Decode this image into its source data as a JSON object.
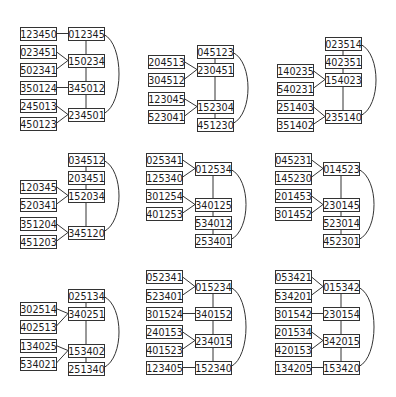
{
  "diagram": {
    "title": "",
    "box_size": {
      "w": 36,
      "h": 13
    },
    "colors": {
      "stroke": "#333333",
      "text": "#1a1a1a",
      "background": "#ffffff"
    },
    "panels": [
      {
        "id": "p1",
        "nodes": [
          {
            "id": "a",
            "label": "123450",
            "x": 20,
            "y": 27
          },
          {
            "id": "b",
            "label": "023451",
            "x": 20,
            "y": 45
          },
          {
            "id": "c",
            "label": "502341",
            "x": 20,
            "y": 63
          },
          {
            "id": "d",
            "label": "350124",
            "x": 20,
            "y": 81
          },
          {
            "id": "e",
            "label": "245013",
            "x": 20,
            "y": 99
          },
          {
            "id": "f",
            "label": "450123",
            "x": 20,
            "y": 117
          },
          {
            "id": "R1",
            "label": "012345",
            "x": 68,
            "y": 27
          },
          {
            "id": "R2",
            "label": "150234",
            "x": 68,
            "y": 54
          },
          {
            "id": "R3",
            "label": "345012",
            "x": 68,
            "y": 81
          },
          {
            "id": "R4",
            "label": "234501",
            "x": 68,
            "y": 108
          }
        ],
        "edges": [
          [
            "a",
            "R1"
          ],
          [
            "b",
            "R2"
          ],
          [
            "c",
            "R2"
          ],
          [
            "d",
            "R3"
          ],
          [
            "e",
            "R4"
          ],
          [
            "f",
            "R4"
          ],
          [
            "R1",
            "R2"
          ],
          [
            "R2",
            "R3"
          ],
          [
            "R3",
            "R4"
          ]
        ],
        "arc": [
          "R1",
          "R4"
        ]
      },
      {
        "id": "p2",
        "nodes": [
          {
            "id": "a",
            "label": "204513",
            "x": 148,
            "y": 55
          },
          {
            "id": "b",
            "label": "304512",
            "x": 148,
            "y": 73
          },
          {
            "id": "c",
            "label": "123045",
            "x": 148,
            "y": 92
          },
          {
            "id": "d",
            "label": "523041",
            "x": 148,
            "y": 110
          },
          {
            "id": "R1",
            "label": "045123",
            "x": 197,
            "y": 45
          },
          {
            "id": "R2",
            "label": "230451",
            "x": 197,
            "y": 63
          },
          {
            "id": "R3",
            "label": "152304",
            "x": 197,
            "y": 100
          },
          {
            "id": "R4",
            "label": "451230",
            "x": 197,
            "y": 118
          }
        ],
        "edges": [
          [
            "a",
            "R2"
          ],
          [
            "b",
            "R2"
          ],
          [
            "c",
            "R3"
          ],
          [
            "d",
            "R3"
          ],
          [
            "R1",
            "R2"
          ],
          [
            "R2",
            "R3"
          ],
          [
            "R3",
            "R4"
          ]
        ],
        "arc": [
          "R1",
          "R4"
        ]
      },
      {
        "id": "p3",
        "nodes": [
          {
            "id": "a",
            "label": "140235",
            "x": 277,
            "y": 64
          },
          {
            "id": "b",
            "label": "540231",
            "x": 277,
            "y": 82
          },
          {
            "id": "c",
            "label": "251403",
            "x": 277,
            "y": 100
          },
          {
            "id": "d",
            "label": "351402",
            "x": 277,
            "y": 118
          },
          {
            "id": "R1",
            "label": "023514",
            "x": 325,
            "y": 37
          },
          {
            "id": "R2",
            "label": "402351",
            "x": 325,
            "y": 55
          },
          {
            "id": "R3",
            "label": "154023",
            "x": 325,
            "y": 73
          },
          {
            "id": "R4",
            "label": "235140",
            "x": 325,
            "y": 110
          }
        ],
        "edges": [
          [
            "a",
            "R3"
          ],
          [
            "b",
            "R3"
          ],
          [
            "c",
            "R4"
          ],
          [
            "d",
            "R4"
          ],
          [
            "R1",
            "R2"
          ],
          [
            "R2",
            "R3"
          ],
          [
            "R3",
            "R4"
          ]
        ],
        "arc": [
          "R1",
          "R4"
        ]
      },
      {
        "id": "p4",
        "nodes": [
          {
            "id": "a",
            "label": "120345",
            "x": 20,
            "y": 180
          },
          {
            "id": "b",
            "label": "520341",
            "x": 20,
            "y": 198
          },
          {
            "id": "c",
            "label": "351204",
            "x": 20,
            "y": 217
          },
          {
            "id": "d",
            "label": "451203",
            "x": 20,
            "y": 235
          },
          {
            "id": "R1",
            "label": "034512",
            "x": 68,
            "y": 153
          },
          {
            "id": "R2",
            "label": "203451",
            "x": 68,
            "y": 171
          },
          {
            "id": "R3",
            "label": "152034",
            "x": 68,
            "y": 189
          },
          {
            "id": "R4",
            "label": "345120",
            "x": 68,
            "y": 226
          }
        ],
        "edges": [
          [
            "a",
            "R3"
          ],
          [
            "b",
            "R3"
          ],
          [
            "c",
            "R4"
          ],
          [
            "d",
            "R4"
          ],
          [
            "R1",
            "R2"
          ],
          [
            "R2",
            "R3"
          ],
          [
            "R3",
            "R4"
          ]
        ],
        "arc": [
          "R1",
          "R4"
        ]
      },
      {
        "id": "p5",
        "nodes": [
          {
            "id": "a",
            "label": "025341",
            "x": 146,
            "y": 153
          },
          {
            "id": "b",
            "label": "125340",
            "x": 146,
            "y": 171
          },
          {
            "id": "c",
            "label": "301254",
            "x": 146,
            "y": 189
          },
          {
            "id": "d",
            "label": "401253",
            "x": 146,
            "y": 207
          },
          {
            "id": "R1",
            "label": "012534",
            "x": 195,
            "y": 162
          },
          {
            "id": "R2",
            "label": "340125",
            "x": 195,
            "y": 198
          },
          {
            "id": "R3",
            "label": "534012",
            "x": 195,
            "y": 216
          },
          {
            "id": "R4",
            "label": "253401",
            "x": 195,
            "y": 234
          }
        ],
        "edges": [
          [
            "a",
            "R1"
          ],
          [
            "b",
            "R1"
          ],
          [
            "c",
            "R2"
          ],
          [
            "d",
            "R2"
          ],
          [
            "R1",
            "R2"
          ],
          [
            "R2",
            "R3"
          ],
          [
            "R3",
            "R4"
          ]
        ],
        "arc": [
          "R1",
          "R4"
        ]
      },
      {
        "id": "p6",
        "nodes": [
          {
            "id": "a",
            "label": "045231",
            "x": 275,
            "y": 153
          },
          {
            "id": "b",
            "label": "145230",
            "x": 275,
            "y": 171
          },
          {
            "id": "c",
            "label": "201453",
            "x": 275,
            "y": 189
          },
          {
            "id": "d",
            "label": "301452",
            "x": 275,
            "y": 207
          },
          {
            "id": "R1",
            "label": "014523",
            "x": 323,
            "y": 162
          },
          {
            "id": "R2",
            "label": "230145",
            "x": 323,
            "y": 198
          },
          {
            "id": "R3",
            "label": "523014",
            "x": 323,
            "y": 216
          },
          {
            "id": "R4",
            "label": "452301",
            "x": 323,
            "y": 234
          }
        ],
        "edges": [
          [
            "a",
            "R1"
          ],
          [
            "b",
            "R1"
          ],
          [
            "c",
            "R2"
          ],
          [
            "d",
            "R2"
          ],
          [
            "R1",
            "R2"
          ],
          [
            "R2",
            "R3"
          ],
          [
            "R3",
            "R4"
          ]
        ],
        "arc": [
          "R1",
          "R4"
        ]
      },
      {
        "id": "p7",
        "nodes": [
          {
            "id": "a",
            "label": "302514",
            "x": 20,
            "y": 302
          },
          {
            "id": "b",
            "label": "402513",
            "x": 20,
            "y": 320
          },
          {
            "id": "c",
            "label": "134025",
            "x": 20,
            "y": 339
          },
          {
            "id": "d",
            "label": "534021",
            "x": 20,
            "y": 357
          },
          {
            "id": "R1",
            "label": "025134",
            "x": 68,
            "y": 289
          },
          {
            "id": "R2",
            "label": "340251",
            "x": 68,
            "y": 307
          },
          {
            "id": "R3",
            "label": "153402",
            "x": 68,
            "y": 344
          },
          {
            "id": "R4",
            "label": "251340",
            "x": 68,
            "y": 362
          }
        ],
        "edges": [
          [
            "a",
            "R2"
          ],
          [
            "b",
            "R2"
          ],
          [
            "c",
            "R3"
          ],
          [
            "d",
            "R3"
          ],
          [
            "R1",
            "R2"
          ],
          [
            "R2",
            "R3"
          ],
          [
            "R3",
            "R4"
          ]
        ],
        "arc": [
          "R1",
          "R4"
        ]
      },
      {
        "id": "p8",
        "nodes": [
          {
            "id": "a",
            "label": "052341",
            "x": 146,
            "y": 270
          },
          {
            "id": "b",
            "label": "523401",
            "x": 146,
            "y": 289
          },
          {
            "id": "c",
            "label": "301524",
            "x": 146,
            "y": 307
          },
          {
            "id": "d",
            "label": "240153",
            "x": 146,
            "y": 325
          },
          {
            "id": "e",
            "label": "401523",
            "x": 146,
            "y": 343
          },
          {
            "id": "f",
            "label": "123405",
            "x": 146,
            "y": 361
          },
          {
            "id": "R1",
            "label": "015234",
            "x": 195,
            "y": 280
          },
          {
            "id": "R2",
            "label": "340152",
            "x": 195,
            "y": 307
          },
          {
            "id": "R3",
            "label": "234015",
            "x": 195,
            "y": 334
          },
          {
            "id": "R4",
            "label": "152340",
            "x": 195,
            "y": 361
          }
        ],
        "edges": [
          [
            "a",
            "R1"
          ],
          [
            "b",
            "R1"
          ],
          [
            "c",
            "R2"
          ],
          [
            "d",
            "R3"
          ],
          [
            "e",
            "R3"
          ],
          [
            "f",
            "R4"
          ],
          [
            "R1",
            "R2"
          ],
          [
            "R2",
            "R3"
          ],
          [
            "R3",
            "R4"
          ]
        ],
        "arc": [
          "R1",
          "R4"
        ]
      },
      {
        "id": "p9",
        "nodes": [
          {
            "id": "a",
            "label": "053421",
            "x": 275,
            "y": 270
          },
          {
            "id": "b",
            "label": "534201",
            "x": 275,
            "y": 289
          },
          {
            "id": "c",
            "label": "301542",
            "x": 275,
            "y": 307
          },
          {
            "id": "d",
            "label": "201534",
            "x": 275,
            "y": 325
          },
          {
            "id": "e",
            "label": "420153",
            "x": 275,
            "y": 343
          },
          {
            "id": "f",
            "label": "134205",
            "x": 275,
            "y": 361
          },
          {
            "id": "R1",
            "label": "015342",
            "x": 323,
            "y": 280
          },
          {
            "id": "R2",
            "label": "230154",
            "x": 323,
            "y": 307
          },
          {
            "id": "R3",
            "label": "342015",
            "x": 323,
            "y": 334
          },
          {
            "id": "R4",
            "label": "153420",
            "x": 323,
            "y": 361
          }
        ],
        "edges": [
          [
            "a",
            "R1"
          ],
          [
            "b",
            "R1"
          ],
          [
            "c",
            "R2"
          ],
          [
            "d",
            "R3"
          ],
          [
            "e",
            "R3"
          ],
          [
            "f",
            "R4"
          ],
          [
            "R1",
            "R2"
          ],
          [
            "R2",
            "R3"
          ],
          [
            "R3",
            "R4"
          ]
        ],
        "arc": [
          "R1",
          "R4"
        ]
      }
    ]
  }
}
